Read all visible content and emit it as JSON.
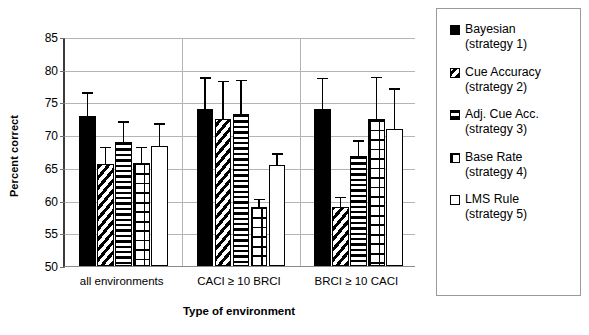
{
  "chart_data": {
    "type": "bar",
    "title": "",
    "xlabel": "Type of environment",
    "ylabel": "Percent correct",
    "ylim": [
      50,
      85
    ],
    "yticks": [
      50,
      55,
      60,
      65,
      70,
      75,
      80,
      85
    ],
    "ytick_labels": [
      "50",
      "55",
      "60",
      "65",
      "70",
      "75",
      "80",
      "85"
    ],
    "grid": true,
    "legend_position": "right",
    "categories": [
      "all environments",
      "CACI ≥ 10 BRCI",
      "BRCI ≥ 10 CACI"
    ],
    "series": [
      {
        "name": "Bayesian (strategy 1)",
        "short_name": "Bayesian",
        "sub_name": "(strategy 1)",
        "pattern": "solid-black",
        "values": [
          72.9,
          74.0,
          74.0
        ],
        "err_upper": [
          3.8,
          5.0,
          4.9
        ],
        "err_lower": [
          0,
          0,
          0
        ]
      },
      {
        "name": "Cue Accuracy (strategy 2)",
        "short_name": "Cue Accuracy",
        "sub_name": "(strategy 2)",
        "pattern": "diagonal-stripes",
        "values": [
          65.6,
          72.5,
          59.0
        ],
        "err_upper": [
          2.8,
          6.0,
          1.7
        ],
        "err_lower": [
          0,
          0,
          0
        ]
      },
      {
        "name": "Adj. Cue Acc. (strategy 3)",
        "short_name": "Adj. Cue Acc.",
        "sub_name": "(strategy 3)",
        "pattern": "horizontal-stripes",
        "values": [
          69.0,
          73.3,
          66.8
        ],
        "err_upper": [
          3.3,
          5.3,
          2.6
        ],
        "err_lower": [
          0,
          0,
          0
        ]
      },
      {
        "name": "Base Rate (strategy 4)",
        "short_name": "Base Rate",
        "sub_name": "(strategy 4)",
        "pattern": "grid",
        "values": [
          65.8,
          59.0,
          72.4
        ],
        "err_upper": [
          2.6,
          1.4,
          6.7
        ],
        "err_lower": [
          0,
          0,
          0
        ]
      },
      {
        "name": "LMS Rule (strategy 5)",
        "short_name": "LMS Rule",
        "sub_name": "(strategy 5)",
        "pattern": "white",
        "values": [
          68.3,
          65.5,
          71.0
        ],
        "err_upper": [
          3.7,
          1.9,
          6.3
        ],
        "err_lower": [
          0,
          0,
          0
        ]
      }
    ],
    "colors": {
      "bar_edge": "#000000",
      "bar_fill_solid": "#000000",
      "bar_fill_open": "#ffffff",
      "gridline": "#b4b4b4",
      "axis": "#3b3b3b",
      "background": "#ffffff"
    }
  },
  "legend": {
    "items": [
      {
        "label": "Bayesian",
        "sub": "(strategy 1)",
        "pattern": "solid-black"
      },
      {
        "label": "Cue Accuracy",
        "sub": "(strategy 2)",
        "pattern": "diagonal-stripes"
      },
      {
        "label": "Adj. Cue Acc.",
        "sub": "(strategy 3)",
        "pattern": "horizontal-stripes"
      },
      {
        "label": "Base Rate",
        "sub": "(strategy 4)",
        "pattern": "grid"
      },
      {
        "label": "LMS Rule",
        "sub": "(strategy 5)",
        "pattern": "white"
      }
    ]
  }
}
